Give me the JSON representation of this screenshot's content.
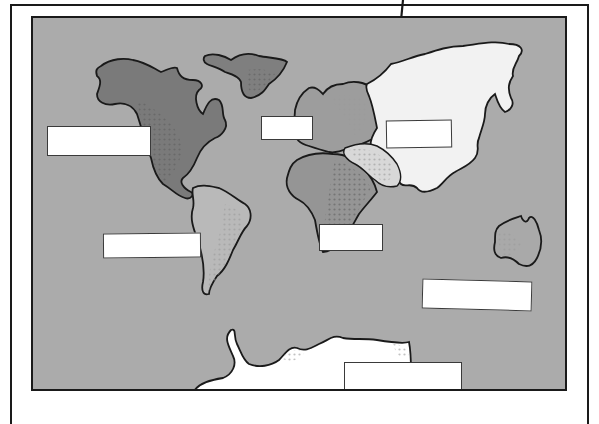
{
  "illustration": {
    "type": "manga-panel",
    "subject": "world map with blank labels",
    "colors": {
      "ocean": "#ababab",
      "frame": "#1a1a1a",
      "north_america": "#7a7a7a",
      "greenland": "#7f7f7f",
      "south_america": "#b9b9b9",
      "europe": "#9d9d9d",
      "africa": "#959595",
      "asia": "#f2f2f2",
      "middle_east": "#d8d8d8",
      "australia": "#a9a9a9",
      "antarctica": "#ffffff",
      "label_fill": "#ffffff"
    },
    "continents": [
      {
        "name": "North America"
      },
      {
        "name": "Greenland"
      },
      {
        "name": "South America"
      },
      {
        "name": "Europe"
      },
      {
        "name": "Africa"
      },
      {
        "name": "Asia"
      },
      {
        "name": "Australia"
      },
      {
        "name": "Antarctica"
      }
    ],
    "labels": [
      {
        "id": "north-america",
        "text": ""
      },
      {
        "id": "europe",
        "text": ""
      },
      {
        "id": "asia",
        "text": ""
      },
      {
        "id": "south-america",
        "text": ""
      },
      {
        "id": "africa",
        "text": ""
      },
      {
        "id": "pacific",
        "text": ""
      },
      {
        "id": "antarctica",
        "text": ""
      }
    ],
    "arrow": {
      "direction": "down",
      "icon": "arrow-down-icon"
    }
  }
}
